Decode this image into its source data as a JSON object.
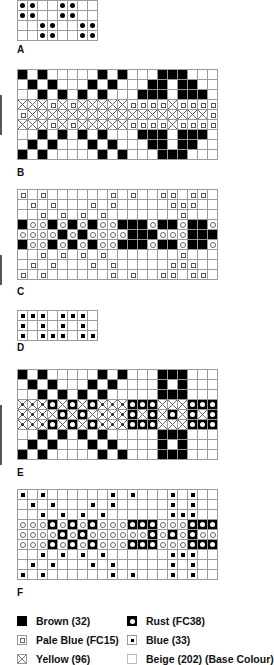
{
  "charts": [
    {
      "id": "A",
      "label": "A",
      "top": 0,
      "label_top": 44,
      "cols": 8,
      "rows": [
        "dd..dd..",
        "dd..dd..",
        "..dd..dd",
        "..dd..dd"
      ]
    },
    {
      "id": "B",
      "label": "B",
      "top": 69,
      "label_top": 167,
      "cols": 20,
      "rows": [
        "B.B.....B.B...BBB...",
        ".B.B...B.B...BB.BB..",
        "..B.B.B.B...BBB.BBB.",
        "YYYPYPYYYYYPPPPYPPPP",
        "PYYYYYYYYYYYYYYYYYYP",
        "YYYPYPYYYYYPPPPYPPPP",
        "..B.B.B.B...BBB.BBB.",
        ".B.B...B.B...BB.BB..",
        "B.B.....B.B...BBB..."
      ]
    },
    {
      "id": "C",
      "label": "C",
      "top": 189,
      "label_top": 286,
      "cols": 20,
      "rows": [
        "P.P......P.P..PP.PP.",
        ".P.P...P.P.....PPP..",
        "..P.P.P.P.......P...",
        "BooBoBoBooBBBoBBoBBo",
        "ooooBoBooooBBBoooBBB",
        "BooBoBoBooBBBoBBoBBo",
        "..P.P.P.P.......P...",
        ".P.P...P.P.....PPP..",
        "P.P......P.P..PP.PP."
      ]
    },
    {
      "id": "D",
      "label": "D",
      "top": 310,
      "label_top": 342,
      "cols": 8,
      "rows": [
        "bbb.bbb.",
        "b.b.b.b.",
        "b.bbb.bb"
      ]
    },
    {
      "id": "E",
      "label": "E",
      "top": 369,
      "label_top": 467,
      "cols": 20,
      "rows": [
        "B.B.....B.B...BBB...",
        ".B.B...B.B....B.B...",
        "..B.B.B.B.....BBB...",
        "yyyRYRYRyyyRRRYYYRRR",
        "yyyYRYRYyyyRYRYRYRYR",
        "yyyRYRYRyyyRRRYYYRRR",
        "..B.B.B.B.....BBB...",
        ".B.B...B.B....B.B...",
        "B.B.....B.B...BBB..."
      ]
    },
    {
      "id": "F",
      "label": "F",
      "top": 489,
      "label_top": 587,
      "cols": 20,
      "rows": [
        "b.b......b.b...b.b..",
        ".b.b...b.b.....b.b..",
        "..b.b.b.b......bbb..",
        "oooRoRoRoooRRRoooRRR",
        "ooooRoRooooooRoRoRoo",
        "oooRoRoRoooRRRoooRRR",
        "..b.b.b.b......bbb..",
        ".b.b...b.b.....b.b..",
        "b.b......b.b...b.b.."
      ]
    }
  ],
  "legend": [
    {
      "key": "brown",
      "label": "Brown (32)",
      "col": 0,
      "row": 0
    },
    {
      "key": "pale",
      "label": "Pale Blue (FC15)",
      "col": 0,
      "row": 1
    },
    {
      "key": "yellow",
      "label": "Yellow (96)",
      "col": 0,
      "row": 2
    },
    {
      "key": "rust",
      "label": "Rust (FC38)",
      "col": 1,
      "row": 0
    },
    {
      "key": "blue",
      "label": "Blue (33)",
      "col": 1,
      "row": 1
    },
    {
      "key": "beige",
      "label": "Beige (202) (Base Colour)",
      "col": 1,
      "row": 2
    }
  ]
}
